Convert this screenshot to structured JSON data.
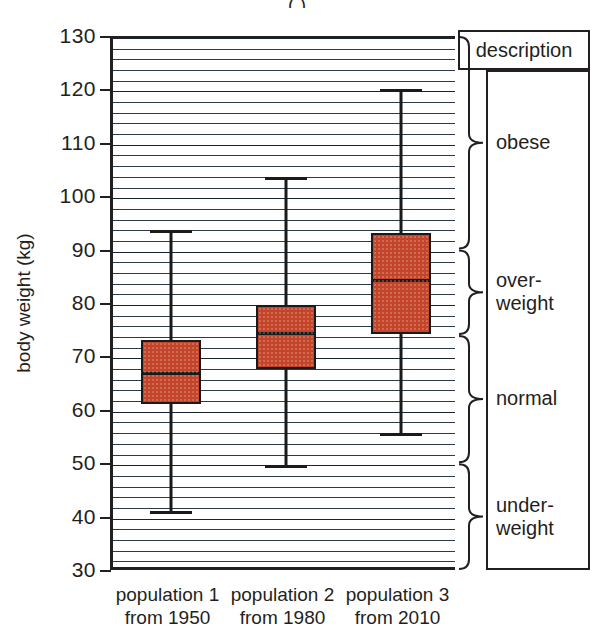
{
  "title": "(  )",
  "axis": {
    "y_label": "body weight (kg)",
    "y_ticks": [
      "130",
      "120",
      "110",
      "100",
      "90",
      "80",
      "70",
      "60",
      "50",
      "40",
      "30"
    ]
  },
  "description_panel": {
    "header": "description",
    "categories": [
      {
        "label": "obese",
        "line1": "obese",
        "line2": ""
      },
      {
        "label": "over-weight",
        "line1": "over-",
        "line2": "weight"
      },
      {
        "label": "normal",
        "line1": "normal",
        "line2": ""
      },
      {
        "label": "under-weight",
        "line1": "under-",
        "line2": "weight"
      }
    ]
  },
  "x_labels": [
    {
      "line1": "population 1",
      "line2": "from 1950"
    },
    {
      "line1": "population 2",
      "line2": "from 1980"
    },
    {
      "line1": "population 3",
      "line2": "from 2010"
    }
  ],
  "colors": {
    "box_fill": "#c4452a",
    "line": "#1a1a1a",
    "grid": "#2b3a4a"
  },
  "chart_data": {
    "type": "box",
    "title": "",
    "xlabel": "",
    "ylabel": "body weight (kg)",
    "ylim": [
      30,
      130
    ],
    "ytick_step": 10,
    "grid": true,
    "legend": "none",
    "categories": [
      "population 1 from 1950",
      "population 2 from 1980",
      "population 3 from 2010"
    ],
    "boxes": [
      {
        "name": "population 1 from 1950",
        "min": 41.5,
        "q1": 61.5,
        "median": 67.5,
        "q3": 73.5,
        "max": 94.0
      },
      {
        "name": "population 2 from 1980",
        "min": 50.0,
        "q1": 68.0,
        "median": 75.0,
        "q3": 80.0,
        "max": 104.0
      },
      {
        "name": "population 3 from 2010",
        "min": 56.0,
        "q1": 74.5,
        "median": 85.0,
        "q3": 93.5,
        "max": 120.5
      }
    ],
    "annotations": [
      {
        "label": "obese",
        "range": [
          90,
          130
        ]
      },
      {
        "label": "over-weight",
        "range": [
          74,
          90
        ]
      },
      {
        "label": "normal",
        "range": [
          50,
          74
        ]
      },
      {
        "label": "under-weight",
        "range": [
          30,
          50
        ]
      }
    ]
  }
}
